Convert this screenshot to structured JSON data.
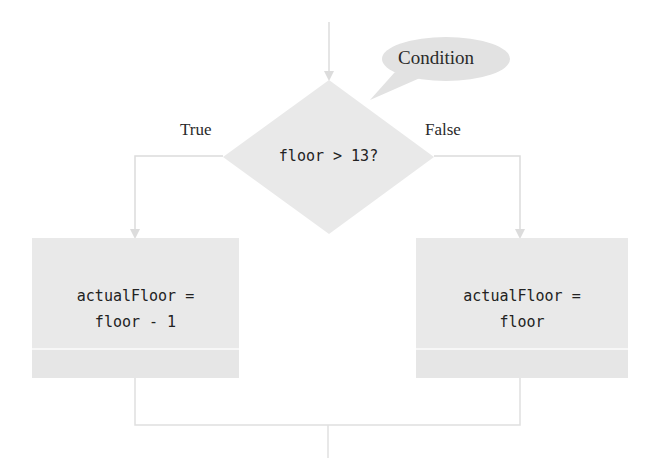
{
  "diagram": {
    "type": "flowchart-decision",
    "callout": {
      "text": "Condition",
      "points_to": "decision"
    },
    "decision": {
      "text": "floor > 13?"
    },
    "branches": {
      "true_label": "True",
      "false_label": "False"
    },
    "true_box": {
      "line1": "actualFloor =",
      "line2": "floor - 1"
    },
    "false_box": {
      "line1": "actualFloor =",
      "line2": "floor"
    },
    "colors": {
      "shape_fill": "#e9e9e9",
      "callout_fill": "#e2e2e2",
      "connector": "#dcdcdc",
      "text": "#222222",
      "background": "#ffffff"
    }
  }
}
